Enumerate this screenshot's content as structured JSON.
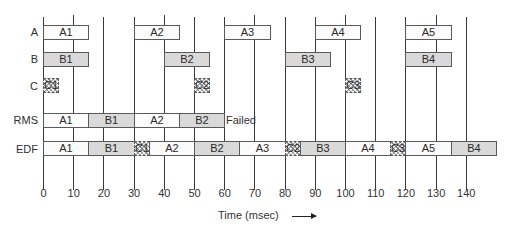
{
  "chart_data": {
    "type": "gantt",
    "xlabel": "Time (msec)",
    "x_ticks": [
      0,
      10,
      20,
      30,
      40,
      50,
      60,
      70,
      80,
      90,
      100,
      110,
      120,
      130,
      140
    ],
    "xlim": [
      0,
      140
    ],
    "rows": [
      {
        "label": "A",
        "style": "white",
        "blocks": [
          {
            "name": "A1",
            "start": 0,
            "end": 15
          },
          {
            "name": "A2",
            "start": 30,
            "end": 45
          },
          {
            "name": "A3",
            "start": 60,
            "end": 75
          },
          {
            "name": "A4",
            "start": 90,
            "end": 105
          },
          {
            "name": "A5",
            "start": 120,
            "end": 135
          }
        ]
      },
      {
        "label": "B",
        "style": "gray",
        "blocks": [
          {
            "name": "B1",
            "start": 0,
            "end": 15
          },
          {
            "name": "B2",
            "start": 40,
            "end": 55
          },
          {
            "name": "B3",
            "start": 80,
            "end": 95
          },
          {
            "name": "B4",
            "start": 120,
            "end": 135
          }
        ]
      },
      {
        "label": "C",
        "style": "hatch",
        "blocks": [
          {
            "name": "C1",
            "start": 0,
            "end": 5
          },
          {
            "name": "C2",
            "start": 50,
            "end": 55
          },
          {
            "name": "C3",
            "start": 100,
            "end": 105
          }
        ]
      },
      {
        "label": "RMS",
        "annotation": "Failed",
        "blocks": [
          {
            "name": "A1",
            "start": 0,
            "end": 15,
            "style": "white"
          },
          {
            "name": "B1",
            "start": 15,
            "end": 30,
            "style": "gray"
          },
          {
            "name": "A2",
            "start": 30,
            "end": 45,
            "style": "white"
          },
          {
            "name": "B2",
            "start": 45,
            "end": 60,
            "style": "gray"
          }
        ]
      },
      {
        "label": "EDF",
        "blocks": [
          {
            "name": "A1",
            "start": 0,
            "end": 15,
            "style": "white"
          },
          {
            "name": "B1",
            "start": 15,
            "end": 30,
            "style": "gray"
          },
          {
            "name": "C1",
            "start": 30,
            "end": 35,
            "style": "hatch"
          },
          {
            "name": "A2",
            "start": 35,
            "end": 50,
            "style": "white"
          },
          {
            "name": "B2",
            "start": 50,
            "end": 65,
            "style": "gray"
          },
          {
            "name": "A3",
            "start": 65,
            "end": 80,
            "style": "white"
          },
          {
            "name": "C2",
            "start": 80,
            "end": 85,
            "style": "hatch"
          },
          {
            "name": "B3",
            "start": 85,
            "end": 100,
            "style": "gray"
          },
          {
            "name": "A4",
            "start": 100,
            "end": 115,
            "style": "white"
          },
          {
            "name": "C3",
            "start": 115,
            "end": 120,
            "style": "hatch"
          },
          {
            "name": "A5",
            "start": 120,
            "end": 135,
            "style": "white"
          },
          {
            "name": "B4",
            "start": 135,
            "end": 150,
            "style": "gray"
          }
        ]
      }
    ],
    "colors": {
      "white": "#fbfbfb",
      "gray": "#d9d9d9",
      "border": "#5a5a5a",
      "line": "#3a3a3a"
    }
  },
  "labels": {
    "axis_title": "Time (msec)",
    "failed": "Failed"
  }
}
